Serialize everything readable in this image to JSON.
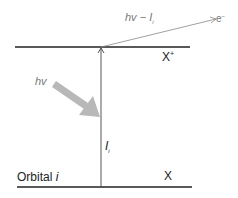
{
  "diagram": {
    "upper_level": {
      "label": "X",
      "superscript": "+"
    },
    "lower_level": {
      "label": "X",
      "orbital_label": "Orbital ",
      "orbital_index": "i"
    },
    "ionization_arrow": {
      "label": "I",
      "subscript": "i"
    },
    "photon": {
      "label": "hv"
    },
    "electron": {
      "energy_label": "hv − I",
      "energy_subscript": "i",
      "label": "e",
      "superscript": "−"
    },
    "colors": {
      "lines": "#222222",
      "photon_arrow": "#b8b8b8",
      "electron_line": "#888888",
      "electron_text": "#777777"
    }
  }
}
